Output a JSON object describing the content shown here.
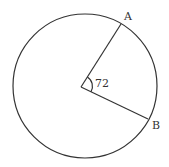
{
  "diagram": {
    "type": "circle-sector",
    "points": {
      "A": {
        "label": "A"
      },
      "B": {
        "label": "B"
      }
    },
    "angle": {
      "label": "72",
      "value_degrees": 72
    },
    "colors": {
      "stroke": "#333333",
      "background": "#ffffff"
    }
  }
}
